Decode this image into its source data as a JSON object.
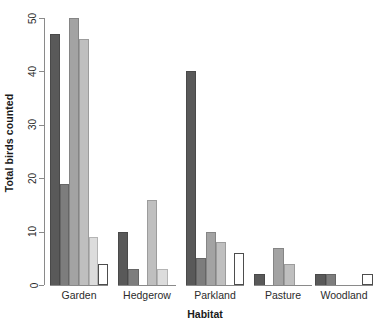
{
  "chart_data": {
    "type": "bar",
    "title": "",
    "xlabel": "Habitat",
    "ylabel": "Total birds counted",
    "categories": [
      "Garden",
      "Hedgerow",
      "Parkland",
      "Pasture",
      "Woodland"
    ],
    "ylim": [
      0,
      50
    ],
    "yticks": [
      0,
      10,
      20,
      30,
      40,
      50
    ],
    "ytick_labels": [
      "0",
      "10",
      "20",
      "30",
      "40",
      "50"
    ],
    "grid": false,
    "legend": "none",
    "bars_per_group": 6,
    "series": [
      {
        "name": "series-1",
        "color": "#595959",
        "values": [
          47,
          10,
          40,
          2,
          2
        ]
      },
      {
        "name": "series-2",
        "color": "#7d7d7d",
        "values": [
          19,
          3,
          5,
          0,
          2
        ]
      },
      {
        "name": "series-3",
        "color": "#a3a3a3",
        "values": [
          50,
          0,
          10,
          7,
          0
        ]
      },
      {
        "name": "series-4",
        "color": "#bfbfbf",
        "values": [
          46,
          16,
          8,
          4,
          0
        ]
      },
      {
        "name": "series-5",
        "color": "#dcdcdc",
        "values": [
          9,
          3,
          0,
          0,
          0
        ]
      },
      {
        "name": "series-6",
        "color": "#ffffff",
        "values": [
          4,
          0,
          6,
          0,
          2
        ]
      }
    ]
  },
  "axis": {
    "y_title": "Total birds counted",
    "x_title": "Habitat",
    "tick_0": "0",
    "tick_10": "10",
    "tick_20": "20",
    "tick_30": "30",
    "tick_40": "40",
    "tick_50": "50"
  },
  "groups": {
    "g0_label": "Garden",
    "g1_label": "Hedgerow",
    "g2_label": "Parkland",
    "g3_label": "Pasture",
    "g4_label": "Woodland"
  }
}
